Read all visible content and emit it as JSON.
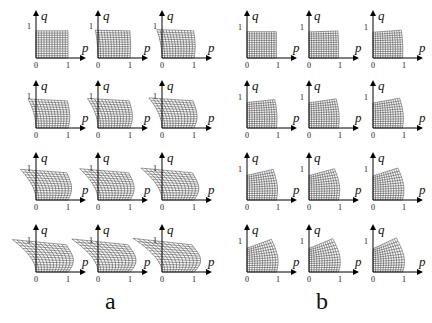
{
  "figure": {
    "panels": [
      {
        "label": "a",
        "rows": 4,
        "cols": 3,
        "axis_origin_x": [
          36,
          98,
          162
        ],
        "axis_origin_y": [
          58,
          128,
          200,
          272
        ],
        "unit": 32,
        "distortion": "leftward-spread"
      },
      {
        "label": "b",
        "rows": 4,
        "cols": 3,
        "axis_origin_x": [
          247,
          309,
          373
        ],
        "axis_origin_y": [
          58,
          128,
          200,
          272
        ],
        "unit": 31,
        "distortion": "top-fold"
      }
    ],
    "axes": {
      "x_label": "p",
      "y_label": "q",
      "origin_tick": "0",
      "unit_tick": "1"
    }
  }
}
